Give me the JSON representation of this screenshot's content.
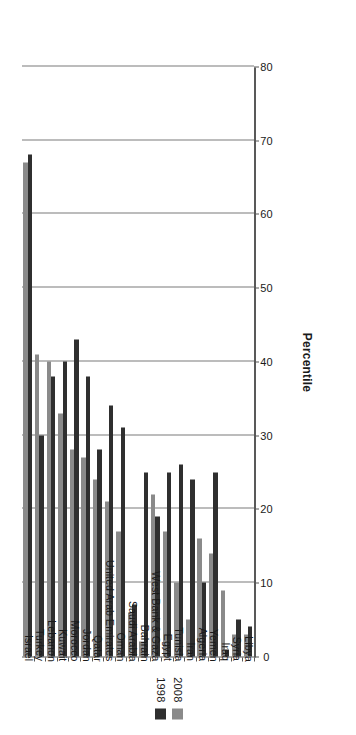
{
  "chart_data": {
    "type": "bar",
    "orientation": "horizontal",
    "title": "",
    "subtitle": "",
    "xlabel": "Percentile",
    "ylabel": "",
    "xlim": [
      0,
      80
    ],
    "xticks": [
      0,
      10,
      20,
      30,
      40,
      50,
      60,
      70,
      80
    ],
    "xtick_labels": [
      "0",
      "10",
      "20",
      "30",
      "40",
      "50",
      "60",
      "70",
      "80"
    ],
    "grid": true,
    "grid_axis": "x",
    "legend_position": "top-left",
    "categories": [
      "Israel",
      "Turkey",
      "Lebanon",
      "Kuwait",
      "Morocco",
      "Jordan",
      "Qatar",
      "United Arab Emirates",
      "Oman",
      "Saudi Arabia",
      "Bahrain",
      "West Bank & Gaza",
      "Egypt",
      "Tunisia",
      "Iran",
      "Algeria",
      "Yemen",
      "Iraq",
      "Syria",
      "Libya"
    ],
    "series": [
      {
        "name": "1998",
        "color": "#2f2f2f",
        "values": [
          68,
          30,
          38,
          40,
          43,
          38,
          28,
          34,
          31,
          7,
          25,
          19,
          25,
          26,
          24,
          10,
          25,
          1,
          5,
          4
        ]
      },
      {
        "name": "2008",
        "color": "#8a8a8a",
        "values": [
          67,
          41,
          40,
          33,
          28,
          27,
          24,
          21,
          17,
          6,
          2,
          22,
          17,
          10,
          5,
          16,
          14,
          9,
          3,
          3
        ]
      }
    ]
  },
  "legend": {
    "items": [
      {
        "label": "1998",
        "color": "#2f2f2f"
      },
      {
        "label": "2008",
        "color": "#8a8a8a"
      }
    ]
  },
  "axis": {
    "value_axis_title": "Percentile"
  }
}
